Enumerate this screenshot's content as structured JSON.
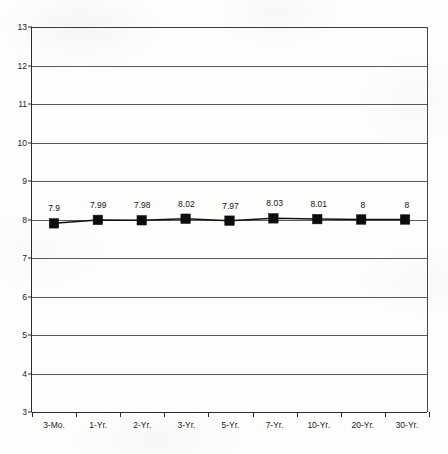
{
  "chart_data": {
    "type": "line",
    "title": "",
    "subtitle": "",
    "xlabel": "",
    "ylabel": "",
    "categories": [
      "3-Mo.",
      "1-Yr.",
      "2-Yr.",
      "3-Yr.",
      "5-Yr.",
      "7-Yr.",
      "10-Yr.",
      "20-Yr.",
      "30-Yr."
    ],
    "values": [
      7.9,
      7.99,
      7.98,
      8.02,
      7.97,
      8.03,
      8.01,
      8,
      8
    ],
    "point_labels": [
      "7.9",
      "7.99",
      "7.98",
      "8.02",
      "7.97",
      "8.03",
      "8.01",
      "8",
      "8"
    ],
    "ylim": [
      3,
      13
    ],
    "ytick_values": [
      13,
      12,
      11,
      10,
      9,
      8,
      7,
      6,
      5,
      4,
      3
    ],
    "ytick_labels": [
      "13",
      "12",
      "11",
      "10",
      "9",
      "8",
      "7",
      "6",
      "5",
      "4",
      "3"
    ],
    "grid": true,
    "grid_axis": "y",
    "legend": false,
    "legend_position": "none",
    "series": [
      {
        "name": "Yield",
        "values": [
          7.9,
          7.99,
          7.98,
          8.02,
          7.97,
          8.03,
          8.01,
          8,
          8
        ],
        "marker": "square",
        "marker_color": "#0c0c0c",
        "line_color": "#111111"
      }
    ]
  },
  "style": {
    "background_color": "#fdfdfc",
    "axis_color": "#2b2b2b",
    "grid_color": "#5a5a5a",
    "text_color": "#1a1a1a"
  }
}
